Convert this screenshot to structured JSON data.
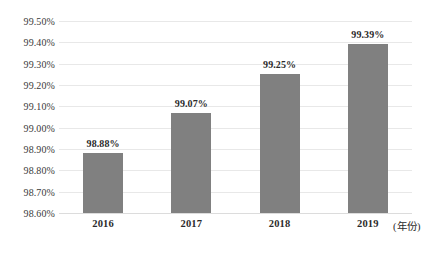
{
  "chart_data": {
    "type": "bar",
    "title": "",
    "subtitle": "",
    "xlabel": "(年份)",
    "ylabel": "",
    "categories": [
      "2016",
      "2017",
      "2018",
      "2019"
    ],
    "values": [
      98.88,
      99.07,
      99.25,
      99.39
    ],
    "value_labels": [
      "98.88%",
      "99.07%",
      "99.25%",
      "99.39%"
    ],
    "ylim": [
      98.6,
      99.5
    ],
    "ytick_step": 0.1,
    "ytick_labels": [
      "99.50%",
      "99.40%",
      "99.30%",
      "99.20%",
      "99.10%",
      "99.00%",
      "98.90%",
      "98.80%",
      "98.70%",
      "98.60%"
    ],
    "ytick_values": [
      99.5,
      99.4,
      99.3,
      99.2,
      99.1,
      99.0,
      98.9,
      98.8,
      98.7,
      98.6
    ],
    "grid": "horizontal",
    "legend": "none",
    "series": [
      {
        "name": "",
        "values": [
          98.88,
          99.07,
          99.25,
          99.39
        ]
      }
    ],
    "colors": {
      "bar_fill": "#808080",
      "gridline": "#e8e8e8",
      "axis_line": "#dcdcdc",
      "label_text": "#2b2b2b",
      "tick_text": "#3a3a3a",
      "background": "#ffffff"
    }
  }
}
